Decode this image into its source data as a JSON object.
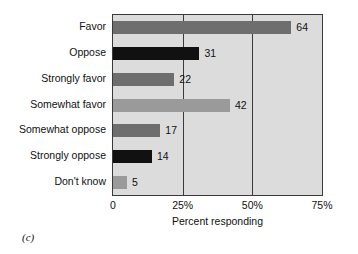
{
  "chart_data": {
    "type": "bar",
    "orientation": "horizontal",
    "title": "",
    "subtitle": "",
    "xlabel": "Percent responding",
    "ylabel": "",
    "categories": [
      "Favor",
      "Oppose",
      "Strongly favor",
      "Somewhat favor",
      "Somewhat oppose",
      "Strongly oppose",
      "Don't know"
    ],
    "values": [
      64,
      31,
      22,
      42,
      17,
      14,
      5
    ],
    "data_labels": [
      "64",
      "31",
      "22",
      "42",
      "17",
      "14",
      "5"
    ],
    "bar_colors": [
      "#6e6e6e",
      "#111111",
      "#6e6e6e",
      "#9a9a9a",
      "#6e6e6e",
      "#111111",
      "#9a9a9a"
    ],
    "xlim": [
      0,
      75
    ],
    "xticks": [
      0,
      25,
      50,
      75
    ],
    "xtick_labels": [
      "0",
      "25%",
      "50%",
      "75%"
    ],
    "gridlines_x": [
      25,
      50
    ],
    "grid": true,
    "legend": "none",
    "plot_background": "#dcdcdc",
    "axis_color": "#3a3a3a"
  },
  "caption": {
    "panel_label": "(c)"
  }
}
